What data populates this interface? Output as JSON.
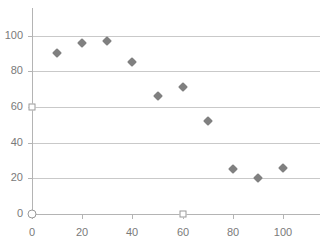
{
  "chart_data": {
    "type": "scatter",
    "title": "",
    "xlabel": "",
    "ylabel": "",
    "x": [
      10,
      20,
      30,
      40,
      50,
      60,
      70,
      80,
      90,
      100
    ],
    "values": [
      90,
      96,
      97,
      85,
      66,
      71,
      52,
      25,
      20,
      26
    ],
    "series": [
      {
        "name": "",
        "marker": "diamond",
        "color": "#808080",
        "points": [
          {
            "x": 10,
            "y": 90
          },
          {
            "x": 20,
            "y": 96
          },
          {
            "x": 30,
            "y": 97
          },
          {
            "x": 40,
            "y": 85
          },
          {
            "x": 50,
            "y": 66
          },
          {
            "x": 60,
            "y": 71
          },
          {
            "x": 70,
            "y": 52
          },
          {
            "x": 80,
            "y": 25
          },
          {
            "x": 90,
            "y": 20
          },
          {
            "x": 100,
            "y": 26
          }
        ]
      }
    ],
    "xlim": [
      0,
      110
    ],
    "ylim": [
      0,
      108
    ],
    "xticks": [
      0,
      20,
      40,
      60,
      80,
      100
    ],
    "yticks": [
      0,
      20,
      40,
      60,
      80,
      100
    ],
    "xtick_labels": [
      "0",
      "20",
      "40",
      "60",
      "80",
      "100"
    ],
    "ytick_labels": [
      "0",
      "20",
      "40",
      "60",
      "80",
      "100"
    ],
    "grid": "horizontal",
    "legend": "none",
    "handles": [
      {
        "name": "origin-handle",
        "shape": "circle",
        "x": 0,
        "y": 0
      },
      {
        "name": "y-axis-handle",
        "shape": "square",
        "x": 0,
        "y": 60
      },
      {
        "name": "x-axis-handle",
        "shape": "square",
        "x": 60,
        "y": 0
      }
    ],
    "colors": {
      "marker": "#808080",
      "gridline": "#c9c9c9",
      "axis": "#b4b4b4",
      "tick_label": "#7a7a7a",
      "background": "#ffffff",
      "handle_fill": "#ffffff",
      "handle_stroke": "#9a9a9a"
    }
  }
}
